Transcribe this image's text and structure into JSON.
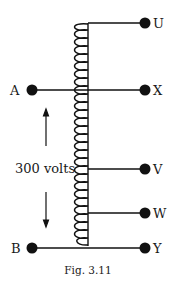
{
  "figure": {
    "caption": "Fig. 3.11",
    "colors": {
      "ink": "#111111",
      "background": "#ffffff"
    }
  },
  "terminals": {
    "U": "U",
    "A": "A",
    "X": "X",
    "V": "V",
    "W": "W",
    "B": "B",
    "Y": "Y"
  },
  "annotation": {
    "voltage": "300 volts"
  }
}
